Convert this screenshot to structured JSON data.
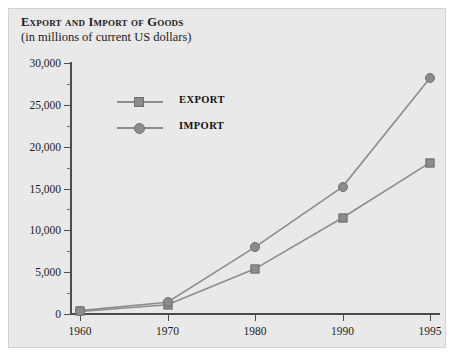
{
  "chart_data": {
    "type": "line",
    "title": "Export and Import of Goods",
    "subtitle": "(in millions of current US dollars)",
    "xlabel": "",
    "ylabel": "",
    "categories": [
      "1960",
      "1970",
      "1980",
      "1990",
      "1995"
    ],
    "series": [
      {
        "name": "EXPORT",
        "marker": "square",
        "color": "#8c8c8c",
        "values": [
          300,
          1100,
          5400,
          11500,
          18100
        ]
      },
      {
        "name": "IMPORT",
        "marker": "circle",
        "color": "#8c8c8c",
        "values": [
          400,
          1400,
          8000,
          15200,
          28200
        ]
      }
    ],
    "ylim": [
      0,
      30000
    ],
    "ytick_labels": [
      "0",
      "5,000",
      "10,000",
      "15,000",
      "20,000",
      "25,000",
      "30,000"
    ],
    "ytick_values": [
      0,
      5000,
      10000,
      15000,
      20000,
      25000,
      30000
    ],
    "yminor_step": 2500,
    "grid": false,
    "legend_position": "upper left"
  },
  "legend": {
    "entries": [
      {
        "label": "EXPORT",
        "marker": "square"
      },
      {
        "label": "IMPORT",
        "marker": "circle"
      }
    ]
  }
}
